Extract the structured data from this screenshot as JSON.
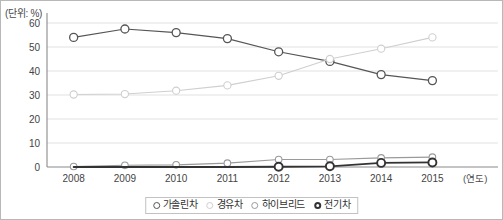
{
  "unit_label": "(단위: %)",
  "x_axis_name": "(연도)",
  "legend": {
    "items": [
      {
        "label": "가솔린차",
        "color": "#555555",
        "marker": "open-circle-dark",
        "width": 1.1
      },
      {
        "label": "경유차",
        "color": "#cfcfcf",
        "marker": "open-circle-light",
        "width": 1.1
      },
      {
        "label": "하이브리드",
        "color": "#9a9a9a",
        "marker": "open-circle-mid",
        "width": 1.1
      },
      {
        "label": "전기차",
        "color": "#333333",
        "marker": "open-circle-bold",
        "width": 1.7
      }
    ]
  },
  "chart_data": {
    "type": "line",
    "title": "",
    "xlabel": "(연도)",
    "ylabel": "(단위: %)",
    "categories": [
      "2008",
      "2009",
      "2010",
      "2011",
      "2012",
      "2013",
      "2014",
      "2015"
    ],
    "x": [
      2008,
      2009,
      2010,
      2011,
      2012,
      2013,
      2014,
      2015
    ],
    "ylim": [
      0,
      60
    ],
    "yticks": [
      0,
      10,
      20,
      30,
      40,
      50,
      60
    ],
    "ytick_labels": [
      "0",
      "10",
      "20",
      "30",
      "40",
      "50",
      "60"
    ],
    "grid": true,
    "legend_position": "bottom-center",
    "series": [
      {
        "name": "가솔린차",
        "color": "#555555",
        "values": [
          54,
          57.5,
          56,
          53.5,
          48,
          44,
          38.5,
          36
        ]
      },
      {
        "name": "경유차",
        "color": "#cfcfcf",
        "values": [
          30.2,
          30.4,
          31.8,
          34,
          38,
          45,
          49.3,
          54
        ]
      },
      {
        "name": "하이브리드",
        "color": "#9a9a9a",
        "values": [
          0.2,
          0.7,
          0.9,
          1.6,
          3.1,
          3.1,
          3.8,
          4.1
        ]
      },
      {
        "name": "전기차",
        "color": "#333333",
        "values": [
          0,
          0,
          0,
          0,
          0.1,
          0.3,
          1.7,
          1.9
        ]
      }
    ]
  }
}
